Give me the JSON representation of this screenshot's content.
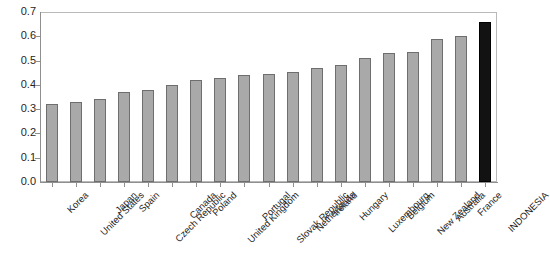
{
  "chart_data": {
    "type": "bar",
    "title": "",
    "subtitle": "",
    "xlabel": "",
    "ylabel": "",
    "ylim": [
      0.0,
      0.7
    ],
    "ytick_labels": [
      "0.7",
      "0.6",
      "0.5",
      "0.4",
      "0.3",
      "0.2",
      "0.1",
      "0.0"
    ],
    "ytick_values": [
      0.7,
      0.6,
      0.5,
      0.4,
      0.3,
      0.2,
      0.1,
      0.0
    ],
    "grid": false,
    "legend": null,
    "legend_position": "none",
    "categories": [
      "Korea",
      "United States",
      "Japan",
      "Spain",
      "Czech Republic",
      "Canada",
      "Poland",
      "United Kingdom",
      "Portugal",
      "Slovak Republic",
      "Netherlands",
      "Ireland",
      "Hungary",
      "Luxembourg",
      "Belgium",
      "New Zealand",
      "Australia",
      "France",
      "INDONESIA"
    ],
    "values": [
      0.32,
      0.33,
      0.34,
      0.37,
      0.38,
      0.4,
      0.42,
      0.43,
      0.44,
      0.445,
      0.455,
      0.47,
      0.48,
      0.51,
      0.53,
      0.535,
      0.59,
      0.6,
      0.66
    ],
    "bar_colors": [
      "#a9a9a9",
      "#a9a9a9",
      "#a9a9a9",
      "#a9a9a9",
      "#a9a9a9",
      "#a9a9a9",
      "#a9a9a9",
      "#a9a9a9",
      "#a9a9a9",
      "#a9a9a9",
      "#a9a9a9",
      "#a9a9a9",
      "#a9a9a9",
      "#a9a9a9",
      "#a9a9a9",
      "#a9a9a9",
      "#a9a9a9",
      "#a9a9a9",
      "#121212"
    ],
    "highlight_category": "INDONESIA",
    "highlight_color": "#121212",
    "series_color": "#a9a9a9",
    "axis_color": "#8f8f8f"
  }
}
